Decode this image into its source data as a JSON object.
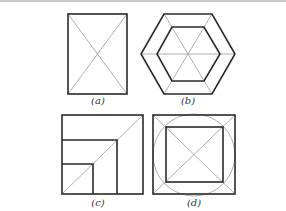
{
  "figure": {
    "panels": [
      {
        "id": "a",
        "label": "(a)",
        "shape": "rectangle with both diagonals"
      },
      {
        "id": "b",
        "label": "(b)",
        "shape": "nested hexagons with vertex-connecting diagonals"
      },
      {
        "id": "c",
        "label": "(c)",
        "shape": "nested squares sharing bottom-left corner with diagonal"
      },
      {
        "id": "d",
        "label": "(d)",
        "shape": "square with inscribed circle and inner square, diagonals"
      }
    ],
    "colors": {
      "thick_line": "#2a2a2a",
      "thin_line": "#9a9a9a",
      "background": "#ffffff"
    }
  }
}
